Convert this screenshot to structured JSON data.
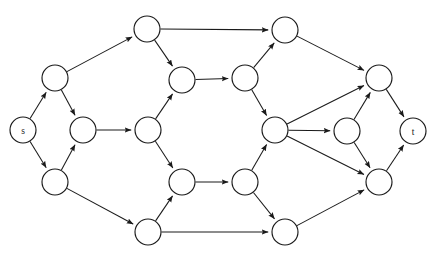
{
  "figure": {
    "name": "flow-network-graph",
    "type": "directed-graph",
    "width": 436,
    "height": 258,
    "background_color": "#ffffff",
    "edge_color": "#1a1a1a",
    "node_fill_color": "#ffffff",
    "node_stroke_color": "#1a1a1a",
    "node_radius": 13,
    "arrowhead": "filled-triangle"
  },
  "graph_data": {
    "directed": true,
    "node_count": 18,
    "edge_count": 28,
    "source_label": "s",
    "sink_label": "t",
    "nodes": [
      {
        "id": "s",
        "label": "s",
        "x": 23,
        "y": 130
      },
      {
        "id": "a1",
        "label": "",
        "x": 55,
        "y": 78
      },
      {
        "id": "a2",
        "label": "",
        "x": 55,
        "y": 182
      },
      {
        "id": "b1",
        "label": "",
        "x": 83,
        "y": 130
      },
      {
        "id": "c1",
        "label": "",
        "x": 147,
        "y": 29
      },
      {
        "id": "c2",
        "label": "",
        "x": 148,
        "y": 130
      },
      {
        "id": "c3",
        "label": "",
        "x": 148,
        "y": 232
      },
      {
        "id": "d1",
        "label": "",
        "x": 182,
        "y": 80
      },
      {
        "id": "d2",
        "label": "",
        "x": 182,
        "y": 182
      },
      {
        "id": "e1",
        "label": "",
        "x": 245,
        "y": 78
      },
      {
        "id": "e2",
        "label": "",
        "x": 245,
        "y": 182
      },
      {
        "id": "f1",
        "label": "",
        "x": 285,
        "y": 30
      },
      {
        "id": "f2",
        "label": "",
        "x": 275,
        "y": 130
      },
      {
        "id": "f3",
        "label": "",
        "x": 285,
        "y": 232
      },
      {
        "id": "g1",
        "label": "",
        "x": 347,
        "y": 131
      },
      {
        "id": "h1",
        "label": "",
        "x": 379,
        "y": 78
      },
      {
        "id": "h2",
        "label": "",
        "x": 379,
        "y": 182
      },
      {
        "id": "t",
        "label": "t",
        "x": 413,
        "y": 131
      }
    ],
    "edges": [
      {
        "from": "s",
        "to": "a1"
      },
      {
        "from": "s",
        "to": "a2"
      },
      {
        "from": "a1",
        "to": "b1"
      },
      {
        "from": "a2",
        "to": "b1"
      },
      {
        "from": "a1",
        "to": "c1"
      },
      {
        "from": "a2",
        "to": "c3"
      },
      {
        "from": "b1",
        "to": "c2"
      },
      {
        "from": "c1",
        "to": "d1"
      },
      {
        "from": "c1",
        "to": "f1"
      },
      {
        "from": "c2",
        "to": "d1"
      },
      {
        "from": "c2",
        "to": "d2"
      },
      {
        "from": "c3",
        "to": "d2"
      },
      {
        "from": "c3",
        "to": "f3"
      },
      {
        "from": "d1",
        "to": "e1"
      },
      {
        "from": "d2",
        "to": "e2"
      },
      {
        "from": "e1",
        "to": "f2"
      },
      {
        "from": "e2",
        "to": "f2"
      },
      {
        "from": "e1",
        "to": "f1"
      },
      {
        "from": "e2",
        "to": "f3"
      },
      {
        "from": "f1",
        "to": "h1"
      },
      {
        "from": "f2",
        "to": "g1"
      },
      {
        "from": "f3",
        "to": "h2"
      },
      {
        "from": "f2",
        "to": "h1"
      },
      {
        "from": "f2",
        "to": "h2"
      },
      {
        "from": "g1",
        "to": "h1"
      },
      {
        "from": "g1",
        "to": "h2"
      },
      {
        "from": "h1",
        "to": "t"
      },
      {
        "from": "h2",
        "to": "t"
      }
    ]
  }
}
